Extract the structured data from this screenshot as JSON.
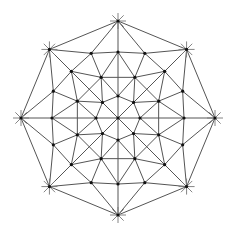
{
  "diagram": {
    "type": "triangulated-octagon-mesh",
    "center": [
      118,
      118
    ],
    "colors": {
      "edge": "#555555",
      "node": "#111111",
      "tick": "#777777",
      "background": "#ffffff"
    },
    "rings": [
      {
        "name": "center",
        "radius": 0,
        "count": 1,
        "phase_deg": 0
      },
      {
        "name": "ring1",
        "radius": 22,
        "count": 8,
        "phase_deg": 0
      },
      {
        "name": "ring2",
        "radius": 44,
        "count": 8,
        "phase_deg": 22.5
      },
      {
        "name": "ring3",
        "radius": 66,
        "count": 8,
        "phase_deg": 0
      },
      {
        "name": "ring3b",
        "radius": 70,
        "count": 8,
        "phase_deg": 22.5
      },
      {
        "name": "outer",
        "radius": 97,
        "count": 8,
        "phase_deg": 0
      }
    ],
    "outer_vertices_have_star_ticks": true,
    "node_count": 49
  }
}
